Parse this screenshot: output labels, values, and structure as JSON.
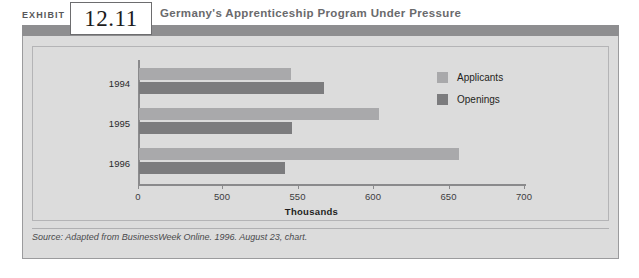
{
  "exhibit": {
    "label": "EXHIBIT",
    "number": "12.11"
  },
  "header": {
    "title": "Germany's Apprenticeship Program Under Pressure",
    "band_color": "#8e8e90"
  },
  "source": {
    "text": "Source: Adapted from BusinessWeek Online. 1996. August 23, chart."
  },
  "legend": {
    "items": [
      {
        "label": "Applicants",
        "color": "#a9a9ab"
      },
      {
        "label": "Openings",
        "color": "#7c7c7e"
      }
    ]
  },
  "axis": {
    "caption": "Thousands",
    "ticks": [
      {
        "label": "0",
        "value": 0
      },
      {
        "label": "500",
        "value": 500
      },
      {
        "label": "550",
        "value": 550
      },
      {
        "label": "600",
        "value": 600
      },
      {
        "label": "650",
        "value": 650
      },
      {
        "label": "700",
        "value": 700
      }
    ]
  },
  "chart_data": {
    "type": "bar",
    "orientation": "horizontal",
    "title": "Germany's Apprenticeship Program Under Pressure",
    "xlabel": "Thousands",
    "ylabel": "",
    "categories": [
      "1994",
      "1995",
      "1996"
    ],
    "series": [
      {
        "name": "Applicants",
        "color": "#a9a9ab",
        "values": [
          545,
          603,
          656
        ]
      },
      {
        "name": "Openings",
        "color": "#7c7c7e",
        "values": [
          567,
          546,
          541
        ]
      }
    ],
    "xlim": [
      0,
      700
    ],
    "axis_break": true,
    "tick_labels": [
      "0",
      "500",
      "550",
      "600",
      "650",
      "700"
    ],
    "grid": false,
    "legend_position": "top-right",
    "note": "x-axis is broken between 0 and 500; 500-700 spaced evenly in 50-unit steps"
  }
}
